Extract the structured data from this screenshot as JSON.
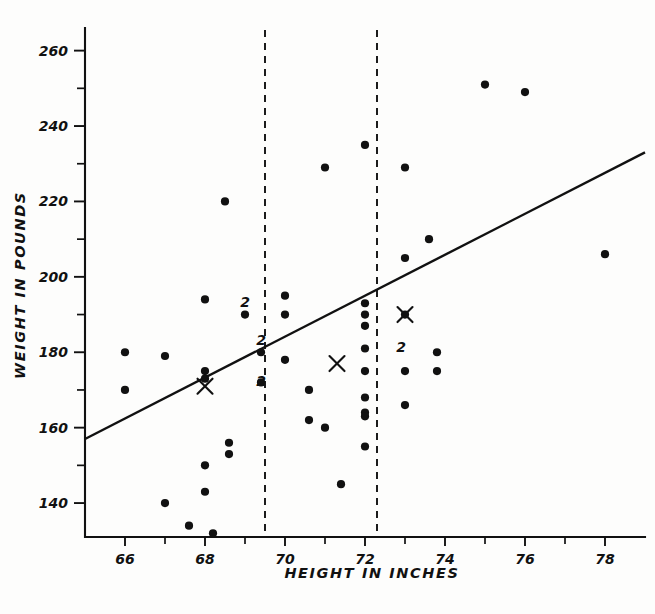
{
  "figure": {
    "background_color": "#fdfdfc",
    "ink_color": "#111111"
  },
  "axes": {
    "x_title": "HEIGHT IN INCHES",
    "y_title": "WEIGHT IN POUNDS",
    "x_tick_labels": [
      "66",
      "68",
      "70",
      "72",
      "74",
      "76",
      "78"
    ],
    "y_tick_labels": [
      "260",
      "240",
      "220",
      "200",
      "180",
      "160",
      "140"
    ]
  },
  "chart_data": {
    "type": "scatter",
    "title": "",
    "xlabel": "HEIGHT IN INCHES",
    "ylabel": "WEIGHT IN POUNDS",
    "xlim": [
      65.0,
      79.0
    ],
    "ylim": [
      131,
      266
    ],
    "xticks": [
      66,
      68,
      70,
      72,
      74,
      76,
      78
    ],
    "xticks_minor": [
      67,
      69,
      71,
      73,
      75,
      77
    ],
    "yticks": [
      140,
      160,
      180,
      200,
      220,
      240,
      260
    ],
    "yticks_minor": [
      150,
      170,
      190,
      210,
      230,
      250
    ],
    "grid": false,
    "legend": false,
    "points": [
      {
        "x": 66.0,
        "y": 180,
        "count": 1
      },
      {
        "x": 66.0,
        "y": 170,
        "count": 1
      },
      {
        "x": 67.0,
        "y": 179,
        "count": 1
      },
      {
        "x": 67.0,
        "y": 140,
        "count": 1
      },
      {
        "x": 67.6,
        "y": 134,
        "count": 1
      },
      {
        "x": 68.0,
        "y": 194,
        "count": 1
      },
      {
        "x": 68.0,
        "y": 175,
        "count": 1
      },
      {
        "x": 68.0,
        "y": 173,
        "count": 1
      },
      {
        "x": 68.0,
        "y": 150,
        "count": 1
      },
      {
        "x": 68.0,
        "y": 143,
        "count": 1
      },
      {
        "x": 68.2,
        "y": 132,
        "count": 1
      },
      {
        "x": 68.5,
        "y": 220,
        "count": 1
      },
      {
        "x": 68.6,
        "y": 156,
        "count": 1
      },
      {
        "x": 68.6,
        "y": 153,
        "count": 1
      },
      {
        "x": 69.0,
        "y": 190,
        "count": 2
      },
      {
        "x": 69.4,
        "y": 180,
        "count": 2
      },
      {
        "x": 69.4,
        "y": 172,
        "count": 2
      },
      {
        "x": 70.0,
        "y": 195,
        "count": 1
      },
      {
        "x": 70.0,
        "y": 190,
        "count": 1
      },
      {
        "x": 70.0,
        "y": 178,
        "count": 1
      },
      {
        "x": 70.6,
        "y": 170,
        "count": 1
      },
      {
        "x": 70.6,
        "y": 162,
        "count": 1
      },
      {
        "x": 71.0,
        "y": 229,
        "count": 1
      },
      {
        "x": 71.0,
        "y": 160,
        "count": 1
      },
      {
        "x": 71.4,
        "y": 145,
        "count": 1
      },
      {
        "x": 72.0,
        "y": 235,
        "count": 1
      },
      {
        "x": 72.0,
        "y": 193,
        "count": 1
      },
      {
        "x": 72.0,
        "y": 190,
        "count": 1
      },
      {
        "x": 72.0,
        "y": 187,
        "count": 1
      },
      {
        "x": 72.0,
        "y": 181,
        "count": 1
      },
      {
        "x": 72.0,
        "y": 175,
        "count": 1
      },
      {
        "x": 72.0,
        "y": 168,
        "count": 1
      },
      {
        "x": 72.0,
        "y": 164,
        "count": 1
      },
      {
        "x": 72.0,
        "y": 163,
        "count": 1
      },
      {
        "x": 72.0,
        "y": 155,
        "count": 1
      },
      {
        "x": 73.0,
        "y": 229,
        "count": 1
      },
      {
        "x": 73.0,
        "y": 205,
        "count": 1
      },
      {
        "x": 73.0,
        "y": 190,
        "count": 2
      },
      {
        "x": 73.0,
        "y": 175,
        "count": 1
      },
      {
        "x": 73.0,
        "y": 166,
        "count": 1
      },
      {
        "x": 73.6,
        "y": 210,
        "count": 1
      },
      {
        "x": 73.8,
        "y": 180,
        "count": 1
      },
      {
        "x": 73.8,
        "y": 175,
        "count": 1
      },
      {
        "x": 75.0,
        "y": 251,
        "count": 1
      },
      {
        "x": 76.0,
        "y": 249,
        "count": 1
      },
      {
        "x": 78.0,
        "y": 206,
        "count": 1
      }
    ],
    "duplicate_labels": [
      {
        "x": 69.0,
        "y": 192,
        "text": "2"
      },
      {
        "x": 69.4,
        "y": 182,
        "text": "2"
      },
      {
        "x": 69.4,
        "y": 171,
        "text": "2"
      },
      {
        "x": 72.9,
        "y": 180,
        "text": "2"
      }
    ],
    "group_means": [
      {
        "x": 68.0,
        "y": 171,
        "marker": "X"
      },
      {
        "x": 71.3,
        "y": 177,
        "marker": "X"
      },
      {
        "x": 73.0,
        "y": 190,
        "marker": "X"
      }
    ],
    "regression_line": {
      "x1": 65.0,
      "y1": 157,
      "x2": 79.0,
      "y2": 233,
      "style": "solid"
    },
    "vertical_dividers": [
      {
        "x": 69.5,
        "style": "dashed"
      },
      {
        "x": 72.3,
        "style": "dashed"
      }
    ]
  }
}
